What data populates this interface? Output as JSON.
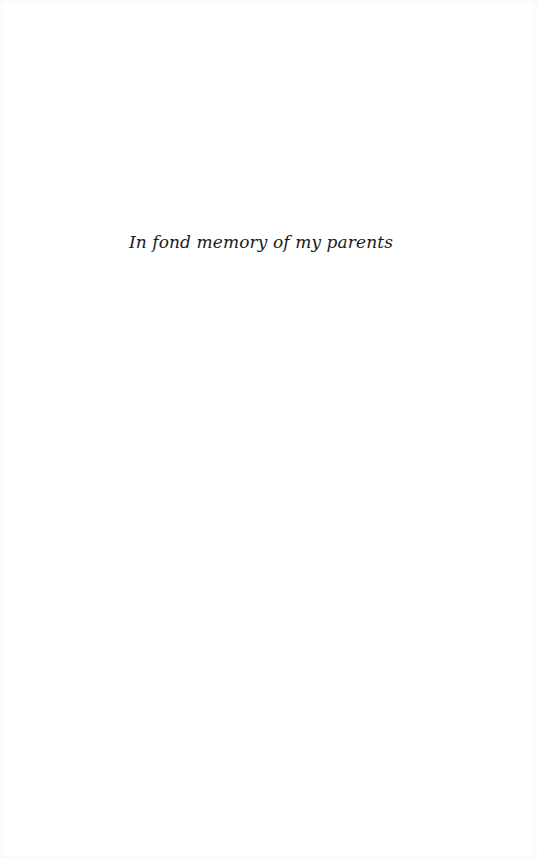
{
  "page": {
    "type": "dedication",
    "dedication_text": "In fond memory of my parents"
  },
  "colors": {
    "background": "#ffffff",
    "text": "#1a1a1a"
  }
}
